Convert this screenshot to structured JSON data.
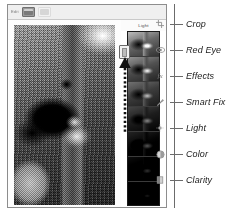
{
  "window": {
    "title": "Photo Editor Quick Edit"
  },
  "toolbar": {
    "mode_label": "Edit",
    "buttons": [
      {
        "name": "single-view-button",
        "icon": "single-photo-icon",
        "state": "active"
      },
      {
        "name": "before-after-button",
        "icon": "split-view-icon",
        "state": "inactive"
      }
    ]
  },
  "canvas": {
    "photo_alt": "Black bear behind tree trunk",
    "photo_name": "bear-photo"
  },
  "adjust_panel": {
    "title": "Light",
    "selected_index": 1,
    "thumbnails": [
      {
        "label": "Light preset 1",
        "level": "l0"
      },
      {
        "label": "Light preset 2",
        "level": "l1"
      },
      {
        "label": "Light preset 3",
        "level": "l2"
      },
      {
        "label": "Light preset 4",
        "level": "l3"
      },
      {
        "label": "Light preset 5",
        "level": "l4"
      },
      {
        "label": "Light preset 6",
        "level": "l5"
      },
      {
        "label": "Light preset 7",
        "level": "l6"
      }
    ]
  },
  "annotation": {
    "pointer_style": "dotted-arrow-up",
    "pointer_target": "selected-light-thumbnail"
  },
  "callouts": {
    "items": [
      {
        "label": "Crop",
        "icon": "crop-icon",
        "top": 14
      },
      {
        "label": "Red Eye",
        "icon": "red-eye-icon",
        "top": 40
      },
      {
        "label": "Effects",
        "icon": "effects-fx-icon",
        "top": 66
      },
      {
        "label": "Smart Fix",
        "icon": "smart-fix-wand-icon",
        "top": 92
      },
      {
        "label": "Light",
        "icon": "light-sun-icon",
        "top": 118
      },
      {
        "label": "Color",
        "icon": "color-wheel-icon",
        "top": 144
      },
      {
        "label": "Clarity",
        "icon": "clarity-icon",
        "top": 170
      }
    ]
  },
  "colors": {
    "window_border": "#8d8d8d",
    "toolbar_bg": "#efefef",
    "callout_line": "#6b6b6b",
    "label_text": "#1b1b1b",
    "strip_bg": "#0a0a0a"
  }
}
